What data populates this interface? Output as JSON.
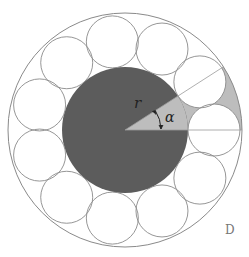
{
  "diagram": {
    "labels": {
      "radius": "r",
      "angle": "α",
      "corner_tag": "D"
    },
    "geometry": {
      "center": [
        125,
        130
      ],
      "outer_radius": 117,
      "inner_disk_radius": 63,
      "ring_circle_count": 11,
      "ring_center_radius": 89,
      "ring_circle_radius": 26,
      "angle_degrees": 32.7
    },
    "colors": {
      "inner_disk": "#5c5c5c",
      "wedge": "#bdbdbd",
      "stroke": "#8a8a8a",
      "background": "#ffffff"
    }
  }
}
